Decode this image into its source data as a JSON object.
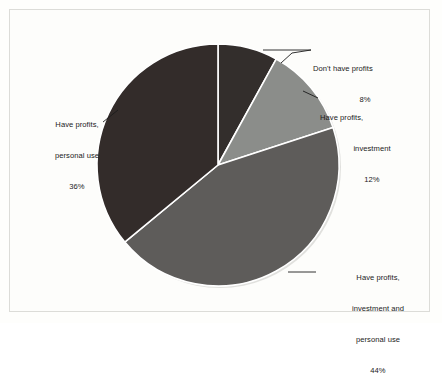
{
  "figure": {
    "background_color": "#fdfdfb",
    "frame_color": "#dcdcd8",
    "separator_color": "#ffffff",
    "leader_line_color": "#1b1b1b"
  },
  "chart_data": {
    "type": "pie",
    "title": "",
    "subtitle": "",
    "xlabel": "",
    "ylabel": "",
    "legend_position": "none",
    "grid": false,
    "start_angle_deg": 0,
    "direction": "clockwise",
    "units": "percent",
    "categories": [
      "Don't have profits",
      "Have profits, investment",
      "Have profits, investment and personal use",
      "Have profits, personal use"
    ],
    "values": [
      8,
      12,
      44,
      36
    ],
    "colors": [
      "#332e2c",
      "#8b8d8a",
      "#5e5c5a",
      "#332c2a"
    ],
    "slices": [
      {
        "name": "Don't have profits",
        "value": 8,
        "value_label": "8%",
        "color": "#332e2c",
        "label_lines": [
          "Don't have profits",
          "8%"
        ]
      },
      {
        "name": "Have profits, investment",
        "value": 12,
        "value_label": "12%",
        "color": "#8b8d8a",
        "label_lines": [
          "Have profits,",
          "investment",
          "12%"
        ]
      },
      {
        "name": "Have profits, investment and personal use",
        "value": 44,
        "value_label": "44%",
        "color": "#5e5c5a",
        "label_lines": [
          "Have profits,",
          "investment and",
          "personal use",
          "44%"
        ]
      },
      {
        "name": "Have profits, personal use",
        "value": 36,
        "value_label": "36%",
        "color": "#332c2a",
        "label_lines": [
          "Have profits,",
          "personal use",
          "36%"
        ]
      }
    ]
  },
  "labels": {
    "dont_have_profits": {
      "line1": "Don't have profits",
      "pct": "8%"
    },
    "have_profits_investment": {
      "line1": "Have profits,",
      "line2": "investment",
      "pct": "12%"
    },
    "have_profits_investment_personal": {
      "line1": "Have profits,",
      "line2": "investment and",
      "line3": "personal use",
      "pct": "44%"
    },
    "have_profits_personal": {
      "line1": "Have profits,",
      "line2": "personal use",
      "pct": "36%"
    }
  }
}
